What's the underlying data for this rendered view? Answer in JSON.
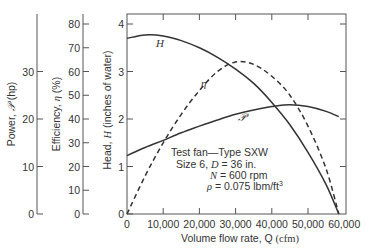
{
  "chart_data": {
    "type": "line",
    "title": "",
    "xlabel": "Volume flow rate, Q (cfm)",
    "xlabel_parts": {
      "text": "Volume flow rate, Q",
      "unit": "(cfm)"
    },
    "xlim": [
      0,
      60000
    ],
    "x_ticks": [
      0,
      10000,
      20000,
      30000,
      40000,
      50000,
      60000
    ],
    "x_tick_labels": [
      "0",
      "10,000",
      "20,000",
      "30,000",
      "40,000",
      "50,000",
      "60,000"
    ],
    "y_axes": [
      {
        "id": "power",
        "label": "Power, 𝒫 (hp)",
        "label_parts": {
          "pre": "Power, ",
          "sym": "𝒫",
          "post": " (hp)"
        },
        "ylim": [
          0,
          40
        ],
        "ticks": [
          0,
          10,
          20,
          30
        ],
        "tick_labels": [
          "0",
          "10",
          "20",
          "30"
        ]
      },
      {
        "id": "efficiency",
        "label": "Efficiency, η (%)",
        "label_parts": {
          "pre": "Efficiency, ",
          "sym": "η",
          "post": " (%)"
        },
        "ylim": [
          0,
          84
        ],
        "ticks": [
          0,
          10,
          20,
          30,
          40,
          50,
          60,
          70,
          80
        ],
        "tick_labels": [
          "0",
          "10",
          "20",
          "30",
          "40",
          "50",
          "60",
          "70",
          "80"
        ]
      },
      {
        "id": "head",
        "label": "Head, H (inches of water)",
        "label_parts": {
          "pre": "Head, ",
          "sym": "H",
          "post": " (inches of water)"
        },
        "ylim": [
          0,
          4.2
        ],
        "ticks": [
          0,
          1,
          2,
          3,
          4
        ],
        "tick_labels": [
          "0",
          "1",
          "2",
          "3",
          "4"
        ]
      }
    ],
    "series": [
      {
        "name": "H",
        "axis": "head",
        "style": "solid",
        "x": [
          0,
          5000,
          10000,
          15000,
          20000,
          25000,
          30000,
          35000,
          40000,
          45000,
          50000,
          55000,
          58500
        ],
        "values": [
          3.7,
          3.77,
          3.75,
          3.65,
          3.5,
          3.3,
          3.05,
          2.75,
          2.35,
          1.88,
          1.3,
          0.62,
          0
        ]
      },
      {
        "name": "η",
        "axis": "efficiency",
        "style": "dashed",
        "x": [
          0,
          5000,
          10000,
          15000,
          20000,
          25000,
          30000,
          35000,
          40000,
          45000,
          50000,
          55000,
          58500
        ],
        "values": [
          0,
          16,
          30,
          42,
          52,
          60,
          64,
          63,
          58,
          50,
          37,
          19,
          0
        ]
      },
      {
        "name": "𝒫",
        "axis": "power",
        "style": "solid",
        "x": [
          0,
          5000,
          10000,
          15000,
          20000,
          25000,
          30000,
          35000,
          40000,
          45000,
          50000,
          55000,
          58500
        ],
        "values": [
          12.3,
          14,
          15.5,
          17.1,
          18.5,
          19.8,
          21,
          21.9,
          22.6,
          23,
          22.6,
          21.6,
          20.5
        ]
      }
    ],
    "annotations": [
      "Test fan—Type SXW",
      "Size 6, D = 36 in.",
      "N = 600 rpm",
      "ρ = 0.075 lbm/ft³"
    ],
    "grid": false,
    "legend": "inline curve labels"
  },
  "labels": {
    "curve_H": "H",
    "curve_eta": "η",
    "curve_P": "𝒫",
    "note1": "Test fan—Type SXW",
    "note2_pre": "Size 6, ",
    "note2_sym": "D",
    "note2_post": " = 36 in.",
    "note3_sym": "N",
    "note3_post": " = 600 rpm",
    "note4_sym": "ρ",
    "note4_post": " = 0.075 lbm/ft",
    "note4_sup": "3"
  },
  "colors": {
    "ink": "#333333",
    "background": "#ffffff"
  }
}
